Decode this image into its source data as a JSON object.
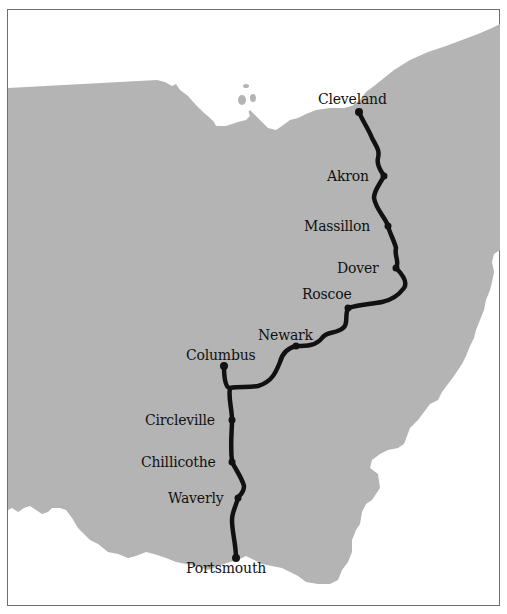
{
  "map": {
    "region": "Ohio",
    "colors": {
      "land": "#b4b4b4",
      "water": "#ffffff",
      "route": "#111111",
      "frame": "#6e6e6e"
    },
    "route": {
      "cities": [
        {
          "name": "Cleveland",
          "label": "Cleveland"
        },
        {
          "name": "Akron",
          "label": "Akron"
        },
        {
          "name": "Massillon",
          "label": "Massillon"
        },
        {
          "name": "Dover",
          "label": "Dover"
        },
        {
          "name": "Roscoe",
          "label": "Roscoe"
        },
        {
          "name": "Newark",
          "label": "Newark"
        },
        {
          "name": "Columbus",
          "label": "Columbus"
        },
        {
          "name": "Circleville",
          "label": "Circleville"
        },
        {
          "name": "Chillicothe",
          "label": "Chillicothe"
        },
        {
          "name": "Waverly",
          "label": "Waverly"
        },
        {
          "name": "Portsmouth",
          "label": "Portsmouth"
        }
      ]
    }
  }
}
